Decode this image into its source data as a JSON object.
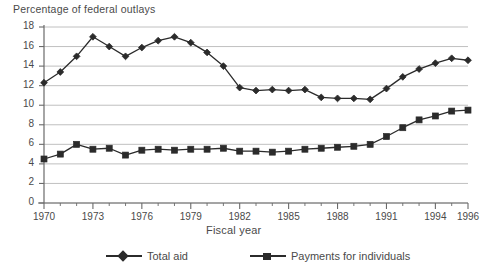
{
  "chart_data": {
    "type": "line",
    "title": "",
    "ylabel": "Percentage of federal outlays",
    "xlabel": "Fiscal year",
    "ylim": [
      0,
      18
    ],
    "xlim": [
      1970,
      1996
    ],
    "ytick_step": 2,
    "yticks": [
      "0",
      "2",
      "4",
      "6",
      "8",
      "10",
      "12",
      "14",
      "16",
      "18"
    ],
    "xticks": [
      "1970",
      "1973",
      "1976",
      "1979",
      "1982",
      "1985",
      "1988",
      "1991",
      "1994",
      "1996"
    ],
    "xtick_values": [
      1970,
      1973,
      1976,
      1979,
      1982,
      1985,
      1988,
      1991,
      1994,
      1996
    ],
    "grid": "horizontal",
    "legend_position": "bottom",
    "x": [
      1970,
      1971,
      1972,
      1973,
      1974,
      1975,
      1976,
      1977,
      1978,
      1979,
      1980,
      1981,
      1982,
      1983,
      1984,
      1985,
      1986,
      1987,
      1988,
      1989,
      1990,
      1991,
      1992,
      1993,
      1994,
      1995,
      1996
    ],
    "series": [
      {
        "name": "Total aid",
        "marker": "diamond",
        "color": "#2b2b2b",
        "values": [
          12.3,
          13.4,
          15.0,
          17.0,
          16.0,
          15.0,
          15.9,
          16.6,
          17.0,
          16.4,
          15.4,
          14.0,
          11.8,
          11.5,
          11.6,
          11.5,
          11.6,
          10.8,
          10.7,
          10.7,
          10.6,
          11.7,
          12.9,
          13.7,
          14.3,
          14.8,
          14.6
        ]
      },
      {
        "name": "Payments for individuals",
        "marker": "square",
        "color": "#2b2b2b",
        "values": [
          4.5,
          5.0,
          6.0,
          5.5,
          5.6,
          4.9,
          5.4,
          5.5,
          5.4,
          5.5,
          5.5,
          5.6,
          5.3,
          5.3,
          5.2,
          5.3,
          5.5,
          5.6,
          5.7,
          5.8,
          6.0,
          6.8,
          7.7,
          8.5,
          8.9,
          9.4,
          9.5
        ]
      }
    ]
  },
  "legend": {
    "entries": [
      {
        "label": "Total aid"
      },
      {
        "label": "Payments for individuals"
      }
    ]
  }
}
